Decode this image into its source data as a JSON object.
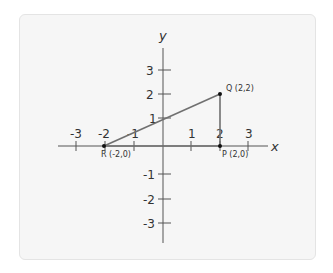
{
  "diagram": {
    "type": "coordinate-plane",
    "axes": {
      "x_label": "x",
      "y_label": "y",
      "x_ticks": [
        {
          "value": -3,
          "label": "-3"
        },
        {
          "value": -2,
          "label": "-2"
        },
        {
          "value": -1,
          "label": "-1"
        },
        {
          "value": 1,
          "label": "1"
        },
        {
          "value": 2,
          "label": "2"
        },
        {
          "value": 3,
          "label": "3"
        }
      ],
      "y_ticks": [
        {
          "value": 3,
          "label": "3"
        },
        {
          "value": 2,
          "label": "2"
        },
        {
          "value": 1,
          "label": "1"
        },
        {
          "value": -1,
          "label": "-1"
        },
        {
          "value": -2,
          "label": "-2"
        },
        {
          "value": -3,
          "label": "-3"
        }
      ]
    },
    "points": [
      {
        "name": "Q",
        "x": 2,
        "y": 2,
        "label": "Q (2,2)"
      },
      {
        "name": "P",
        "x": 2,
        "y": 0,
        "label": "P (2,0)"
      },
      {
        "name": "R",
        "x": -2,
        "y": 0,
        "label": "R (-2,0)"
      }
    ],
    "segments": [
      {
        "from": "R",
        "to": "Q"
      },
      {
        "from": "Q",
        "to": "P"
      },
      {
        "from": "P",
        "to": "R"
      }
    ],
    "colors": {
      "card_background": "#f6f6f6",
      "axis": "#555555",
      "triangle": "#707070",
      "point": "#111111",
      "text": "#333333"
    }
  }
}
